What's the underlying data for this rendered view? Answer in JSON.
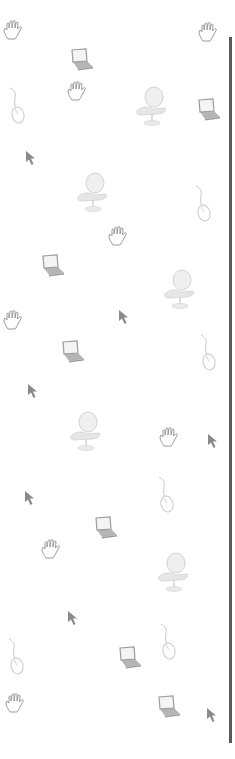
{
  "background": {
    "color": "#ffffff",
    "rule": {
      "color": "#5a5a5a",
      "x": 229,
      "top": 37,
      "bottom": 743
    },
    "icon_colors": {
      "hand": "#9a9a9a",
      "laptop": "#9c9c9c",
      "mouse": "#c8c8c8",
      "chair": "#d2d2d2",
      "cursor": "#8a8a8a"
    },
    "icons": [
      {
        "type": "hand",
        "x": 14,
        "y": 30
      },
      {
        "type": "laptop",
        "x": 80,
        "y": 60
      },
      {
        "type": "hand",
        "x": 209,
        "y": 32
      },
      {
        "type": "mouse",
        "x": 17,
        "y": 105
      },
      {
        "type": "hand",
        "x": 78,
        "y": 91
      },
      {
        "type": "chair",
        "x": 152,
        "y": 107
      },
      {
        "type": "laptop",
        "x": 207,
        "y": 110
      },
      {
        "type": "cursor",
        "x": 31,
        "y": 158
      },
      {
        "type": "chair",
        "x": 93,
        "y": 193
      },
      {
        "type": "mouse",
        "x": 203,
        "y": 203
      },
      {
        "type": "laptop",
        "x": 51,
        "y": 266
      },
      {
        "type": "hand",
        "x": 119,
        "y": 236
      },
      {
        "type": "chair",
        "x": 180,
        "y": 290
      },
      {
        "type": "hand",
        "x": 14,
        "y": 320
      },
      {
        "type": "cursor",
        "x": 124,
        "y": 317
      },
      {
        "type": "laptop",
        "x": 71,
        "y": 352
      },
      {
        "type": "mouse",
        "x": 208,
        "y": 352
      },
      {
        "type": "cursor",
        "x": 33,
        "y": 391
      },
      {
        "type": "chair",
        "x": 86,
        "y": 432
      },
      {
        "type": "hand",
        "x": 170,
        "y": 437
      },
      {
        "type": "cursor",
        "x": 213,
        "y": 441
      },
      {
        "type": "mouse",
        "x": 166,
        "y": 494
      },
      {
        "type": "cursor",
        "x": 30,
        "y": 498
      },
      {
        "type": "laptop",
        "x": 104,
        "y": 528
      },
      {
        "type": "hand",
        "x": 52,
        "y": 549
      },
      {
        "type": "chair",
        "x": 174,
        "y": 573
      },
      {
        "type": "cursor",
        "x": 73,
        "y": 618
      },
      {
        "type": "mouse",
        "x": 168,
        "y": 641
      },
      {
        "type": "mouse",
        "x": 16,
        "y": 656
      },
      {
        "type": "laptop",
        "x": 128,
        "y": 658
      },
      {
        "type": "hand",
        "x": 16,
        "y": 703
      },
      {
        "type": "laptop",
        "x": 167,
        "y": 707
      },
      {
        "type": "cursor",
        "x": 212,
        "y": 715
      }
    ]
  }
}
